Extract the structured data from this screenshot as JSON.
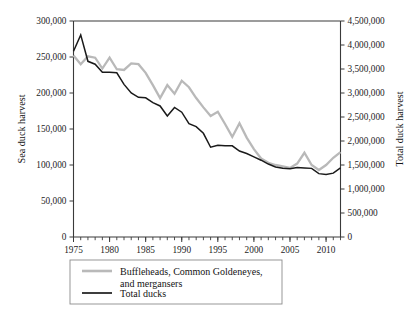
{
  "chart_data": {
    "type": "line",
    "title": "",
    "xlabel": "",
    "ylabel": "Sea duck harvest",
    "y2label": "Total duck harvest",
    "grid": false,
    "legend_position": "below-center",
    "xlim": [
      1975,
      2012
    ],
    "xticks": [
      1975,
      1980,
      1985,
      1990,
      1995,
      2000,
      2005,
      2010
    ],
    "xtick_labels": [
      "1975",
      "1980",
      "1985",
      "1990",
      "1995",
      "2000",
      "2005",
      "2010"
    ],
    "x_minor_tick_interval": 1,
    "ylim": [
      0,
      300000
    ],
    "yticks": [
      0,
      50000,
      100000,
      150000,
      200000,
      250000,
      300000
    ],
    "ytick_labels": [
      "0",
      "50,000",
      "100,000",
      "150,000",
      "200,000",
      "250,000",
      "300,000"
    ],
    "y2lim": [
      0,
      4500000
    ],
    "y2ticks": [
      0,
      500000,
      1000000,
      1500000,
      2000000,
      2500000,
      3000000,
      3500000,
      4000000,
      4500000
    ],
    "y2tick_labels": [
      "0",
      "500,000",
      "1,000,000",
      "1,500,000",
      "2,000,000",
      "2,500,000",
      "3,000,000",
      "3,500,000",
      "4,000,000",
      "4,500,000"
    ],
    "x": [
      1975,
      1976,
      1977,
      1978,
      1979,
      1980,
      1981,
      1982,
      1983,
      1984,
      1985,
      1986,
      1987,
      1988,
      1989,
      1990,
      1991,
      1992,
      1993,
      1994,
      1995,
      1996,
      1997,
      1998,
      1999,
      2000,
      2001,
      2002,
      2003,
      2004,
      2005,
      2006,
      2007,
      2008,
      2009,
      2010,
      2011,
      2012
    ],
    "series": [
      {
        "name": "Buffleheads, Common Goldeneyes, and mergansers",
        "axis": "left",
        "color": "#b9b9b9",
        "values": [
          252000,
          240000,
          251000,
          249000,
          234000,
          249000,
          233000,
          232000,
          241000,
          240000,
          228000,
          211000,
          193000,
          211000,
          199000,
          217000,
          208000,
          193000,
          180000,
          168000,
          174000,
          157000,
          139000,
          158000,
          138000,
          122000,
          109000,
          103000,
          100000,
          98000,
          96000,
          102000,
          117000,
          100000,
          93000,
          100000,
          110000,
          118000
        ]
      },
      {
        "name": "Total ducks",
        "axis": "right",
        "color": "#1a1a1a",
        "values": [
          3870000,
          4210000,
          3660000,
          3600000,
          3430000,
          3430000,
          3420000,
          3180000,
          3000000,
          2910000,
          2900000,
          2800000,
          2730000,
          2520000,
          2700000,
          2600000,
          2360000,
          2300000,
          2160000,
          1870000,
          1910000,
          1900000,
          1900000,
          1790000,
          1740000,
          1670000,
          1600000,
          1520000,
          1460000,
          1430000,
          1420000,
          1450000,
          1440000,
          1430000,
          1320000,
          1300000,
          1330000,
          1440000
        ]
      }
    ],
    "legend_entries": [
      {
        "label_line1": "Buffleheads, Common Goldeneyes,",
        "label_line2": "and mergansers",
        "color": "#b9b9b9"
      },
      {
        "label_line1": "Total ducks",
        "label_line2": "",
        "color": "#1a1a1a"
      }
    ]
  }
}
